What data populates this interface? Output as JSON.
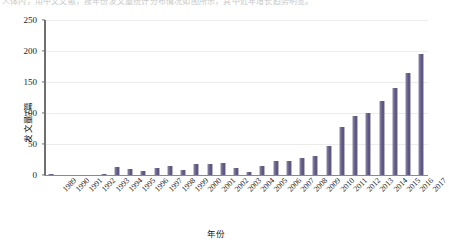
{
  "top_caption": "人体内，用中文文献，按年份发文量统计分布情况如图所示，其中近年增长趋势明显。",
  "chart_data": {
    "type": "bar",
    "title": "",
    "xlabel": "年份",
    "ylabel": "发文量/篇",
    "ylim": [
      0,
      250
    ],
    "yticks": [
      0,
      50,
      100,
      150,
      200,
      250
    ],
    "grid": true,
    "legend": "none",
    "bar_color": "#6f6790",
    "categories": [
      "1989",
      "1990",
      "1991",
      "1992",
      "1993",
      "1994",
      "1995",
      "1996",
      "1997",
      "1998",
      "1999",
      "2000",
      "2001",
      "2002",
      "2003",
      "2004",
      "2005",
      "2006",
      "2007",
      "2008",
      "2009",
      "2010",
      "2011",
      "2012",
      "2013",
      "2014",
      "2015",
      "2016",
      "2017"
    ],
    "values": [
      1,
      0,
      0,
      0,
      2,
      13,
      10,
      6,
      11,
      15,
      8,
      18,
      17,
      19,
      11,
      5,
      14,
      23,
      22,
      27,
      30,
      47,
      78,
      95,
      100,
      120,
      140,
      165,
      195
    ]
  }
}
